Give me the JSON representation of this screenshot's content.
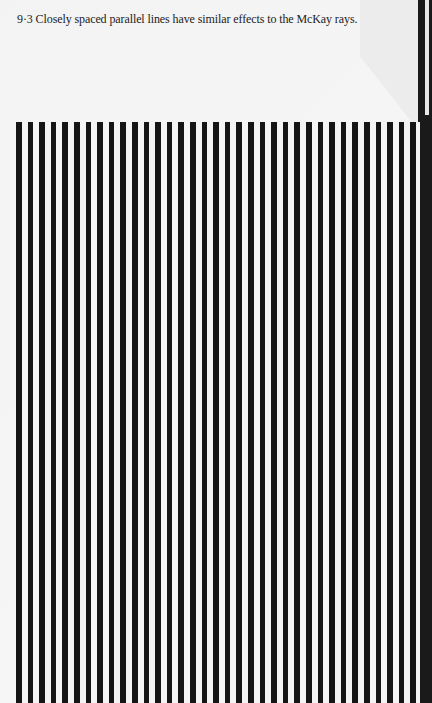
{
  "figure": {
    "number": "9·3",
    "caption": "9·3 Closely spaced parallel lines have similar effects to the McKay rays.",
    "pattern": {
      "type": "vertical-parallel-lines",
      "line_color": "#151515",
      "background_color": "#f4f4f4",
      "approx_line_count": 35
    }
  }
}
